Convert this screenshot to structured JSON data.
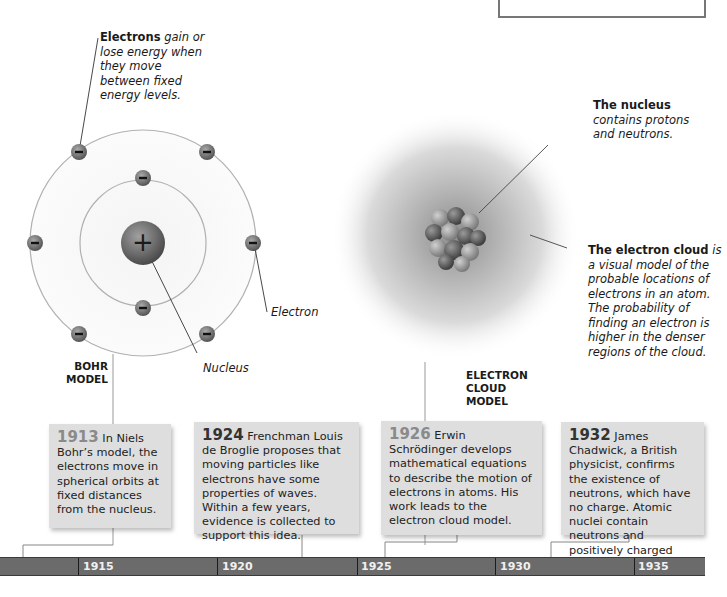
{
  "bohr": {
    "electrons_caption_bold": "Electrons",
    "electrons_caption_italic": "gain or lose energy when they move between fixed energy levels.",
    "electron_label": "Electron",
    "nucleus_label": "Nucleus",
    "model_label_line1": "BOHR",
    "model_label_line2": "MODEL",
    "nucleus_symbol": "+",
    "electron_symbol": "−"
  },
  "cloud": {
    "nucleus_caption_bold": "The nucleus",
    "nucleus_caption_italic": "contains protons and neutrons.",
    "cloud_caption_bold": "The electron cloud",
    "cloud_caption_italic": "is a visual model of the probable locations of electrons in an atom. The probability of finding an electron is higher in the denser regions of the cloud.",
    "model_label_line1": "ELECTRON",
    "model_label_line2": "CLOUD",
    "model_label_line3": "MODEL"
  },
  "events": [
    {
      "year": "1913",
      "text": "In Niels Bohr’s model, the electrons move in spherical orbits at fixed distances from the nucleus."
    },
    {
      "year": "1924",
      "text": "Frenchman Louis de Broglie proposes that moving particles like electrons have some properties of waves. Within a few years, evidence is collected to support this idea."
    },
    {
      "year": "1926",
      "text": "Erwin Schrödinger develops mathematical equations to describe the motion of electrons in atoms. His work leads to the electron cloud model."
    },
    {
      "year": "1932",
      "text": "James Chadwick, a British physicist, confirms the existence of neutrons, which have no charge. Atomic nuclei contain neutrons and positively charged protons."
    }
  ],
  "timeline": {
    "ticks": [
      "1915",
      "1920",
      "1925",
      "1930",
      "1935"
    ]
  },
  "colors": {
    "timeline_bar": "#6b6b6b",
    "card_bg": "#dedede",
    "year_gray": "#8a8a8a",
    "orbit": "#aaaaaa"
  }
}
